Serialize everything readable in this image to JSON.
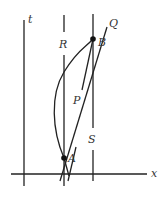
{
  "diagram": {
    "type": "spacetime-diagram",
    "axes": {
      "vertical_label": "t",
      "horizontal_label": "x"
    },
    "labels": {
      "R": "R",
      "S": "S",
      "P": "P",
      "Q": "Q",
      "A": "A",
      "B": "B"
    },
    "events": [
      {
        "name": "A",
        "x": 64,
        "y": 158
      },
      {
        "name": "B",
        "x": 93,
        "y": 39
      }
    ],
    "worldlines": [
      {
        "name": "R",
        "kind": "vertical",
        "x": 64
      },
      {
        "name": "S",
        "kind": "vertical",
        "x": 93
      },
      {
        "name": "P",
        "kind": "straight",
        "from": "A",
        "to": "B"
      },
      {
        "name": "Q",
        "kind": "straight-through-A-and-B"
      },
      {
        "name": "curve",
        "kind": "curved",
        "from": "A",
        "to": "B"
      }
    ],
    "colors": {
      "line": "#222222",
      "text": "#333333",
      "background": "#ffffff"
    }
  }
}
